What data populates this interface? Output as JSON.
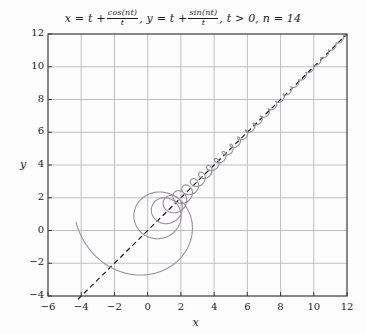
{
  "chart_data": {
    "type": "line",
    "title_parts": {
      "p1": "x = t +",
      "frac1_num": "cos(nt)",
      "frac1_den": "t",
      "p2": ", y = t +",
      "frac2_num": "sin(nt)",
      "frac2_den": "t",
      "p3": ", t > 0, n = 14"
    },
    "xlabel": "x",
    "ylabel": "y",
    "xlim": [
      -6,
      12
    ],
    "ylim": [
      -4,
      12
    ],
    "xticks": [
      -6,
      -4,
      -2,
      0,
      2,
      4,
      6,
      8,
      10,
      12
    ],
    "xtick_labels": [
      "−6",
      "−4",
      "−2",
      "0",
      "2",
      "4",
      "6",
      "8",
      "10",
      "12"
    ],
    "yticks": [
      -4,
      -2,
      0,
      2,
      4,
      6,
      8,
      10,
      12
    ],
    "ytick_labels": [
      "−4",
      "−2",
      "0",
      "2",
      "4",
      "6",
      "8",
      "10",
      "12"
    ],
    "grid": true,
    "grid_color": "#b8b8c0",
    "frame_color": "#3a3a3a",
    "background_color": "#fdfdfd",
    "legend": null,
    "series": [
      {
        "name": "parametric-spiral",
        "kind": "parametric",
        "style": "solid",
        "color": "#9a8f9a",
        "linewidth": 1.1,
        "n": 14,
        "t_start": 0.22,
        "t_end": 12.0,
        "formula_x": "t + cos(n*t)/t",
        "formula_y": "t + sin(n*t)/t"
      },
      {
        "name": "asymptote-y-equals-x",
        "kind": "line",
        "style": "dashed",
        "color": "#1a1a1a",
        "linewidth": 1.2,
        "x": [
          -4.2,
          12
        ],
        "y": [
          -4.2,
          12
        ]
      }
    ],
    "annotations": []
  }
}
